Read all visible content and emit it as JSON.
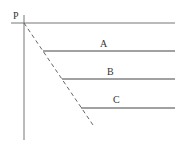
{
  "diagram": {
    "point_label": "P",
    "lines": [
      {
        "label": "A"
      },
      {
        "label": "B"
      },
      {
        "label": "C"
      }
    ],
    "colors": {
      "line": "#555555",
      "text": "#333333"
    }
  }
}
